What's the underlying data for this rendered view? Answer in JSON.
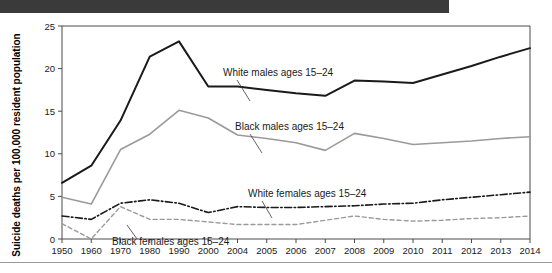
{
  "top_bar": {
    "color": "#3a3a3a"
  },
  "chart_data": {
    "type": "line",
    "title": "",
    "xlabel": "",
    "ylabel": "Suicide deaths per 100,000 resident population",
    "ylim": [
      0,
      25
    ],
    "yticks": [
      0,
      5,
      10,
      15,
      20,
      25
    ],
    "ytick_labels": [
      "0",
      "5",
      "10",
      "15",
      "20",
      "25"
    ],
    "grid": false,
    "legend_position": "inline-annotations",
    "categories": [
      "1950",
      "1960",
      "1970",
      "1980",
      "1990",
      "2000",
      "2004",
      "2005",
      "2006",
      "2007",
      "2008",
      "2009",
      "2010",
      "2011",
      "2012",
      "2013",
      "2014"
    ],
    "series": [
      {
        "name": "White males ages 15-24",
        "label": "White males ages 15–24",
        "color": "#1a1a1a",
        "width": 2.0,
        "dash": "none",
        "values": [
          6.6,
          8.6,
          13.9,
          21.4,
          23.2,
          17.9,
          17.9,
          17.5,
          17.1,
          16.8,
          18.6,
          18.5,
          18.3,
          19.3,
          20.3,
          21.4,
          22.4
        ]
      },
      {
        "name": "Black males ages 15-24",
        "label": "Black males ages 15–24",
        "color": "#9a9a9a",
        "width": 1.6,
        "dash": "none",
        "values": [
          4.9,
          4.1,
          10.5,
          12.3,
          15.1,
          14.2,
          12.2,
          11.8,
          11.3,
          10.4,
          12.4,
          11.8,
          11.1,
          11.3,
          11.5,
          11.8,
          12.0
        ]
      },
      {
        "name": "White females ages 15-24",
        "label": "White females ages 15–24",
        "color": "#1a1a1a",
        "width": 1.6,
        "dash": "dash-dot",
        "values": [
          2.7,
          2.3,
          4.2,
          4.6,
          4.2,
          3.1,
          3.8,
          3.7,
          3.7,
          3.8,
          3.9,
          4.1,
          4.2,
          4.6,
          4.9,
          5.2,
          5.5
        ]
      },
      {
        "name": "Black females ages 15-24",
        "label": "Black females ages 15–24",
        "color": "#9a9a9a",
        "width": 1.4,
        "dash": "dashed",
        "values": [
          1.8,
          0.0,
          3.8,
          2.3,
          2.3,
          2.0,
          1.7,
          1.7,
          1.7,
          2.2,
          2.7,
          2.3,
          2.1,
          2.2,
          2.4,
          2.5,
          2.7
        ]
      }
    ],
    "annotations": [
      {
        "name": "annotation-white-males",
        "text": "White males ages 15–24",
        "x": 223,
        "y": 63,
        "leader": "M 237 67 L 250 88"
      },
      {
        "name": "annotation-black-males",
        "text": "Black males ages 15–24",
        "x": 235,
        "y": 117,
        "leader": "M 250 121 L 262 140"
      },
      {
        "name": "annotation-white-females",
        "text": "White females ages 15–24",
        "x": 248,
        "y": 184,
        "leader": "M 262 188 L 272 205"
      },
      {
        "name": "annotation-black-females",
        "text": "Black females ages 15–24",
        "x": 112,
        "y": 232,
        "leader": "M 137 226 L 127 212"
      }
    ]
  }
}
